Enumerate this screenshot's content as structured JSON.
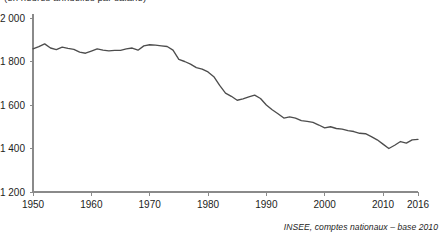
{
  "top_caption": "(en heures annuelles par salarié)",
  "source_note": "INSEE, comptes nationaux – base 2010",
  "colors": {
    "line": "#4d4d4d",
    "axis": "#8a8a8a",
    "text": "#1d1d1b",
    "background": "#ffffff"
  },
  "chart_data": {
    "type": "line",
    "title": "",
    "subtitle": "(en heures annuelles par salarié)",
    "xlabel": "",
    "ylabel": "",
    "ylim": [
      1200,
      2000
    ],
    "xlim": [
      1950,
      2016
    ],
    "grid": false,
    "legend": false,
    "y_ticks": [
      1200,
      1400,
      1600,
      1800,
      2000
    ],
    "y_tick_labels": [
      "1 200",
      "1 400",
      "1 600",
      "1 800",
      "2 000"
    ],
    "x_ticks": [
      1950,
      1960,
      1970,
      1980,
      1990,
      2000,
      2010,
      2016
    ],
    "x_tick_labels": [
      "1950",
      "1960",
      "1970",
      "1980",
      "1990",
      "2000",
      "2010",
      "2016"
    ],
    "series": [
      {
        "name": "Heures annuelles par salarié",
        "x": [
          1950,
          1951,
          1952,
          1953,
          1954,
          1955,
          1956,
          1957,
          1958,
          1959,
          1960,
          1961,
          1962,
          1963,
          1964,
          1965,
          1966,
          1967,
          1968,
          1969,
          1970,
          1971,
          1972,
          1973,
          1974,
          1975,
          1976,
          1977,
          1978,
          1979,
          1980,
          1981,
          1982,
          1983,
          1984,
          1985,
          1986,
          1987,
          1988,
          1989,
          1990,
          1991,
          1992,
          1993,
          1994,
          1995,
          1996,
          1997,
          1998,
          1999,
          2000,
          2001,
          2002,
          2003,
          2004,
          2005,
          2006,
          2007,
          2008,
          2009,
          2010,
          2011,
          2012,
          2013,
          2014,
          2015,
          2016
        ],
        "values": [
          1858,
          1868,
          1881,
          1862,
          1855,
          1866,
          1860,
          1856,
          1843,
          1838,
          1848,
          1858,
          1852,
          1849,
          1851,
          1851,
          1858,
          1862,
          1852,
          1872,
          1877,
          1875,
          1872,
          1869,
          1852,
          1810,
          1800,
          1788,
          1772,
          1765,
          1752,
          1730,
          1690,
          1655,
          1640,
          1622,
          1628,
          1637,
          1645,
          1630,
          1600,
          1578,
          1560,
          1540,
          1545,
          1540,
          1528,
          1525,
          1520,
          1508,
          1495,
          1500,
          1492,
          1489,
          1482,
          1478,
          1470,
          1468,
          1455,
          1440,
          1420,
          1400,
          1415,
          1432,
          1425,
          1440,
          1442
        ]
      }
    ],
    "annotations": [
      {
        "text": "INSEE, comptes nationaux – base 2010",
        "position": "bottom-right"
      }
    ]
  }
}
